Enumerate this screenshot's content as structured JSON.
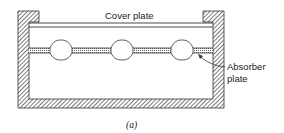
{
  "figure": {
    "caption": "(a)",
    "labels": {
      "cover_plate": "Cover plate",
      "absorber_line1": "Absorber",
      "absorber_line2": "plate"
    },
    "components": [
      "housing-wall",
      "cover-plate",
      "absorber-plate",
      "fluid-tubes"
    ],
    "tube_count": 3,
    "colors": {
      "line": "#333333",
      "hatch": "#555555",
      "background": "#ffffff"
    }
  }
}
